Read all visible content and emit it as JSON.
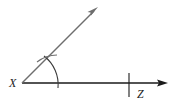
{
  "diagram": {
    "type": "geometric-construction",
    "labels": {
      "vertex": "X",
      "point": "Z"
    },
    "colors": {
      "base_ray": "#1a1a1a",
      "constructed_ray": "#6e6e6e",
      "arc": "#3a3a3a"
    },
    "elements": [
      {
        "kind": "ray",
        "name": "base-ray",
        "from": [
          22,
          83
        ],
        "to": [
          168,
          83
        ]
      },
      {
        "kind": "ray",
        "name": "constructed-ray",
        "from": [
          22,
          83
        ],
        "to": [
          98,
          7
        ]
      },
      {
        "kind": "arc",
        "name": "construction-arc",
        "center": [
          22,
          83
        ],
        "radius": 36
      },
      {
        "kind": "tick",
        "name": "z-tick",
        "at": [
          129,
          83
        ]
      },
      {
        "kind": "cross-mark",
        "name": "intersection-mark",
        "at": [
          47,
          58
        ]
      }
    ]
  }
}
